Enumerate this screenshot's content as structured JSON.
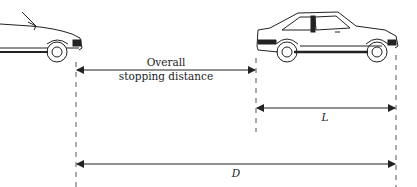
{
  "diagram": {
    "labels": {
      "overall_line1": "Overall",
      "overall_line2": "stopping distance",
      "car_length": "L",
      "total_distance": "D"
    },
    "elements": [
      {
        "id": "car-front",
        "description": "Front of a car (partial, left edge)"
      },
      {
        "id": "car-rear",
        "description": "Hatchback car (side view)"
      }
    ],
    "colors": {
      "line": "#333333",
      "car": "#222222",
      "background": "#ffffff"
    }
  }
}
